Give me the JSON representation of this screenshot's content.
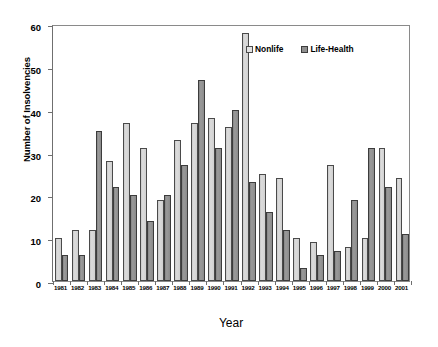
{
  "chart_data": {
    "type": "bar",
    "title": "",
    "xlabel": "Year",
    "ylabel": "Number of Insolvencies",
    "ylim": [
      0,
      60
    ],
    "yticks": [
      0,
      10,
      20,
      30,
      40,
      50,
      60
    ],
    "grid": false,
    "legend_position": "top-right",
    "categories": [
      "1981",
      "1982",
      "1983",
      "1984",
      "1985",
      "1986",
      "1987",
      "1988",
      "1989",
      "1990",
      "1991",
      "1992",
      "1993",
      "1994",
      "1995",
      "1996",
      "1997",
      "1998",
      "1999",
      "2000",
      "2001"
    ],
    "series": [
      {
        "name": "Nonlife",
        "color": "#d2d2d2",
        "values": [
          10,
          12,
          12,
          28,
          37,
          31,
          19,
          33,
          37,
          38,
          36,
          58,
          25,
          24,
          10,
          9,
          27,
          8,
          10,
          31,
          24
        ]
      },
      {
        "name": "Life-Health",
        "color": "#8f8f8f",
        "values": [
          6,
          6,
          35,
          22,
          20,
          14,
          20,
          27,
          47,
          31,
          40,
          23,
          16,
          12,
          3,
          6,
          7,
          19,
          31,
          22,
          11
        ]
      }
    ]
  },
  "legend": {
    "items": [
      {
        "label": "Nonlife",
        "swatch": "nonlife"
      },
      {
        "label": "Life-Health",
        "swatch": "life"
      }
    ]
  },
  "axes": {
    "y_title": "Number of Insolvencies",
    "x_title": "Year"
  }
}
